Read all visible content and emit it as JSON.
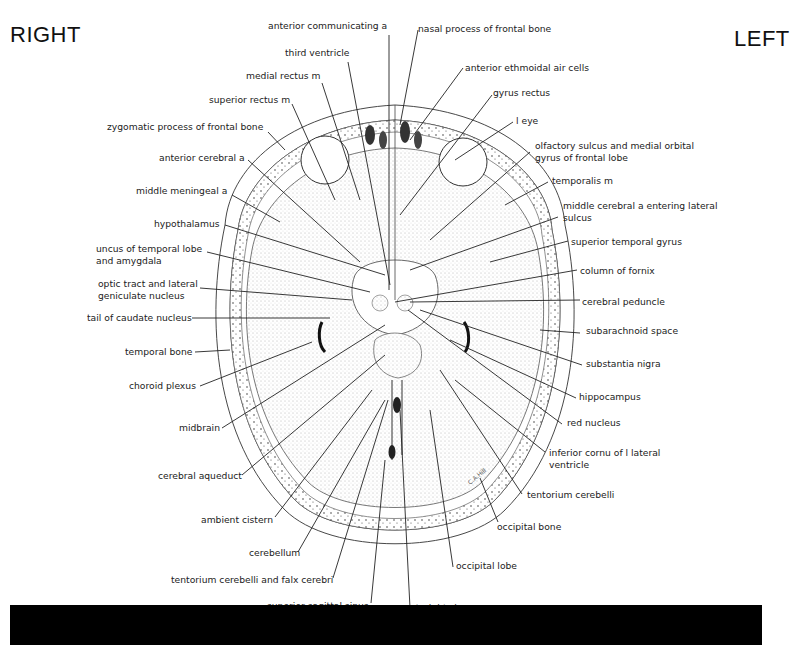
{
  "orientation": {
    "right": "RIGHT",
    "left": "LEFT"
  },
  "signature": "C.A.Hill",
  "labels": {
    "anterior_communicating_a": "anterior communicating a",
    "nasal_process_frontal_bone": "nasal process of frontal bone",
    "third_ventricle": "third ventricle",
    "anterior_ethmoidal_air_cells": "anterior ethmoidal air cells",
    "medial_rectus_m": "medial rectus m",
    "gyrus_rectus": "gyrus rectus",
    "superior_rectus_m": "superior rectus m",
    "l_eye": "l eye",
    "zygomatic_process": "zygomatic process of frontal bone",
    "olfactory_sulcus_1": "olfactory sulcus and medial orbital",
    "olfactory_sulcus_2": "gyrus of frontal lobe",
    "anterior_cerebral_a": "anterior cerebral a",
    "temporalis_m": "temporalis m",
    "middle_meningeal_a": "middle meningeal a",
    "middle_cerebral_a_1": "middle cerebral a entering lateral",
    "middle_cerebral_a_2": "sulcus",
    "hypothalamus": "hypothalamus",
    "superior_temporal_gyrus": "superior temporal gyrus",
    "uncus_1": "uncus of temporal lobe",
    "uncus_2": "and amygdala",
    "column_of_fornix": "column of fornix",
    "optic_tract_1": "optic tract and lateral",
    "optic_tract_2": "geniculate nucleus",
    "cerebral_peduncle": "cerebral peduncle",
    "tail_of_caudate": "tail of caudate nucleus",
    "subarachnoid_space": "subarachnoid space",
    "temporal_bone": "temporal bone",
    "substantia_nigra": "substantia nigra",
    "choroid_plexus": "choroid plexus",
    "hippocampus": "hippocampus",
    "midbrain": "midbrain",
    "red_nucleus": "red nucleus",
    "inferior_cornu_1": "inferior cornu of l lateral",
    "inferior_cornu_2": "ventricle",
    "cerebral_aqueduct": "cerebral aqueduct",
    "tentorium_cerebelli": "tentorium cerebelli",
    "occipital_bone": "occipital bone",
    "ambient_cistern": "ambient cistern",
    "cerebellum": "cerebellum",
    "occipital_lobe": "occipital lobe",
    "tentorium_falx": "tentorium cerebelli and falx cerebri",
    "superior_sagittal_sinus": "superior sagittal sinus",
    "straight_sinus": "straight sinus"
  }
}
